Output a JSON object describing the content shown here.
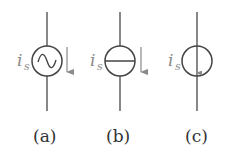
{
  "diagram": {
    "type": "circuit-symbols",
    "stroke_color": "#555555",
    "label_color": "#8a8a8a",
    "arrow_color": "#8a8a8a",
    "symbols": [
      {
        "id": "a",
        "caption": "(a)",
        "variable": "i",
        "subscript": "s",
        "kind": "ac-current-source",
        "icon": "sine-wave-icon",
        "arrow": "down"
      },
      {
        "id": "b",
        "caption": "(b)",
        "variable": "i",
        "subscript": "s",
        "kind": "current-source",
        "icon": "horizontal-bar-icon",
        "arrow": "down"
      },
      {
        "id": "c",
        "caption": "(c)",
        "variable": "i",
        "subscript": "s",
        "kind": "current-source-internal-arrow",
        "icon": "internal-arrow-icon",
        "arrow": "down-inside"
      }
    ]
  }
}
